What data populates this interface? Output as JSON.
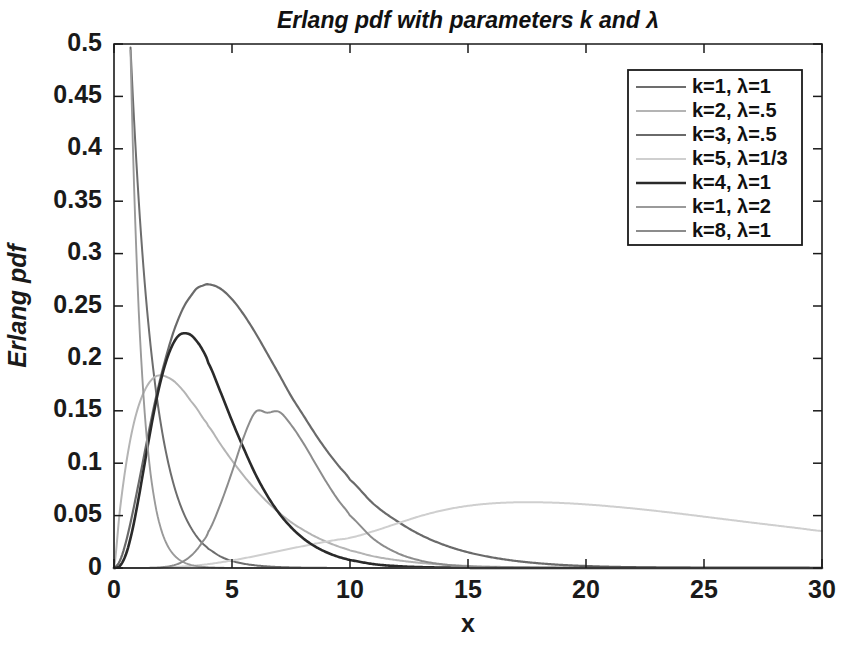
{
  "chart_data": {
    "type": "line",
    "title": "Erlang pdf with parameters k and λ",
    "xlabel": "x",
    "ylabel": "Erlang pdf",
    "xlim": [
      0,
      30
    ],
    "ylim": [
      0,
      0.5
    ],
    "xticks": [
      "0",
      "5",
      "10",
      "15",
      "20",
      "25",
      "30"
    ],
    "xtick_values": [
      0,
      5,
      10,
      15,
      20,
      25,
      30
    ],
    "yticks": [
      "0",
      "0.05",
      "0.1",
      "0.15",
      "0.2",
      "0.25",
      "0.3",
      "0.35",
      "0.4",
      "0.45",
      "0.5"
    ],
    "ytick_values": [
      0,
      0.05,
      0.1,
      0.15,
      0.2,
      0.25,
      0.3,
      0.35,
      0.4,
      0.45,
      0.5
    ],
    "grid": false,
    "legend_position": "top-right",
    "x": [
      0,
      0.25,
      0.5,
      0.75,
      1,
      1.25,
      1.5,
      1.75,
      2,
      2.25,
      2.5,
      2.75,
      3,
      3.25,
      3.5,
      3.75,
      4,
      4.5,
      5,
      5.5,
      6,
      6.5,
      7,
      7.5,
      8,
      8.5,
      9,
      9.5,
      10,
      11,
      12,
      13,
      14,
      15,
      16,
      17,
      18,
      19,
      20,
      21,
      22,
      23,
      24,
      25,
      26,
      27,
      28,
      29,
      30
    ],
    "series": [
      {
        "name": "k=1, λ=1",
        "k": 1,
        "lambda": 1,
        "color": "#6d6d6d",
        "width": 2.0,
        "peak_x": 0,
        "peak_y": 1.0,
        "values": [
          1,
          0.7788,
          0.6065,
          0.4724,
          0.3679,
          0.2865,
          0.2231,
          0.1738,
          0.1353,
          0.1054,
          0.0821,
          0.0639,
          0.0498,
          0.0388,
          0.0302,
          0.0235,
          0.0183,
          0.0111,
          0.0067,
          0.0041,
          0.0025,
          0.0015,
          0.0009,
          0.00055,
          0.00034,
          0.0002,
          0.00012,
          7.5e-05,
          4.54e-05,
          1.67e-05,
          6.14e-06,
          2.26e-06,
          8.3e-07,
          3e-07,
          1.1e-07,
          4e-08,
          1.5e-08,
          5.6e-09,
          2e-09,
          7.6e-10,
          2.8e-10,
          1e-10,
          4e-11,
          1.4e-11,
          5e-12,
          1.9e-12,
          7e-13,
          2.5e-13,
          9e-14
        ]
      },
      {
        "name": "k=2, λ=.5",
        "k": 2,
        "lambda": 0.5,
        "color": "#b4b4b4",
        "width": 2.0,
        "peak_x": 2,
        "peak_y": 0.1839,
        "values": [
          0,
          0.0551,
          0.0973,
          0.129,
          0.1516,
          0.167,
          0.1771,
          0.1826,
          0.1839,
          0.1822,
          0.179,
          0.1738,
          0.1673,
          0.1596,
          0.1524,
          0.1437,
          0.1353,
          0.1185,
          0.1026,
          0.0879,
          0.0747,
          0.0629,
          0.0527,
          0.0438,
          0.0366,
          0.0303,
          0.025,
          0.0206,
          0.0168,
          0.0111,
          0.00744,
          0.00485,
          0.00313,
          0.002,
          0.00127,
          0.0008,
          0.0005,
          0.00031,
          0.00019,
          0.000117,
          7.16e-05,
          4.36e-05,
          2.65e-05,
          1.6e-05,
          9.7e-06,
          5.8e-06,
          3.5e-06,
          2.1e-06,
          1.25e-06
        ]
      },
      {
        "name": "k=3, λ=.5",
        "k": 3,
        "lambda": 0.5,
        "color": "#6a6a6a",
        "width": 2.2,
        "peak_x": 4,
        "peak_y": 0.1353,
        "values": [
          0,
          0.0069,
          0.0243,
          0.0484,
          0.0758,
          0.1044,
          0.1329,
          0.1598,
          0.1839,
          0.205,
          0.2238,
          0.2389,
          0.251,
          0.2594,
          0.2666,
          0.2694,
          0.2707,
          0.2667,
          0.2565,
          0.2417,
          0.224,
          0.2044,
          0.1845,
          0.1642,
          0.1465,
          0.1288,
          0.1125,
          0.0979,
          0.0842,
          0.0611,
          0.0446,
          0.0315,
          0.0219,
          0.015,
          0.0102,
          0.0068,
          0.0045,
          0.0029,
          0.0019,
          0.0012,
          0.00079,
          0.0005,
          0.00032,
          0.0002,
          0.000126,
          7.85e-05,
          4.87e-05,
          3.02e-05,
          1.87e-05
        ]
      },
      {
        "name": "k=5, λ=1/3",
        "k": 5,
        "lambda": 0.333333,
        "color": "#cfcfcf",
        "width": 2.0,
        "peak_x": 12,
        "peak_y": 0.0627,
        "values": [
          0,
          1e-07,
          1.8e-06,
          8.5e-06,
          2.6e-05,
          6.05e-05,
          0.00012,
          0.000213,
          0.000349,
          0.000536,
          0.000782,
          0.001095,
          0.001479,
          0.001937,
          0.00247,
          0.003079,
          0.003763,
          0.005351,
          0.007198,
          0.009257,
          0.011476,
          0.013798,
          0.016168,
          0.018535,
          0.020852,
          0.023077,
          0.025176,
          0.027122,
          0.028896,
          0.035112,
          0.0425,
          0.0497,
          0.0554,
          0.0593,
          0.0616,
          0.06265,
          0.0627,
          0.062,
          0.0607,
          0.0589,
          0.0568,
          0.0544,
          0.0518,
          0.049,
          0.0462,
          0.0434,
          0.0407,
          0.038,
          0.0353
        ]
      },
      {
        "name": "k=4, λ=1",
        "k": 4,
        "lambda": 1,
        "color": "#2a2a2a",
        "width": 2.6,
        "peak_x": 3,
        "peak_y": 0.224,
        "values": [
          0,
          0.002,
          0.0126,
          0.0332,
          0.0613,
          0.0933,
          0.1255,
          0.1553,
          0.1804,
          0.2,
          0.2138,
          0.222,
          0.224,
          0.2224,
          0.2166,
          0.2082,
          0.1954,
          0.1687,
          0.1404,
          0.1139,
          0.0892,
          0.0688,
          0.0521,
          0.0389,
          0.0286,
          0.0208,
          0.015,
          0.0107,
          0.00757,
          0.00368,
          0.00177,
          0.00084,
          0.00039,
          0.00018,
          8.6e-05,
          3.9e-05,
          1.78e-05,
          8e-06,
          3.6e-06,
          1.6e-06,
          7e-07,
          3e-07,
          1.4e-07,
          6e-08,
          2.6e-08,
          1.1e-08,
          4.8e-09,
          2e-09,
          9e-10
        ]
      },
      {
        "name": "k=1, λ=2",
        "k": 1,
        "lambda": 2,
        "color": "#9a9a9a",
        "width": 1.9,
        "peak_x": 0,
        "peak_y": 2.0,
        "values": [
          2,
          1.2131,
          0.7358,
          0.4463,
          0.2707,
          0.1642,
          0.0996,
          0.0604,
          0.0366,
          0.0222,
          0.0135,
          0.0082,
          0.005,
          0.003,
          0.0018,
          0.0011,
          0.00067,
          0.00025,
          9e-05,
          3.3e-05,
          1.2e-05,
          4.5e-06,
          1.7e-06,
          6e-07,
          2.2e-07,
          8e-08,
          3e-08,
          1e-08,
          4.1e-09,
          5.5e-10,
          7.6e-11,
          1e-11,
          1.4e-12,
          1.9e-13,
          2.5e-14,
          0,
          0,
          0,
          0,
          0,
          0,
          0,
          0,
          0,
          0,
          0,
          0,
          0,
          0
        ]
      },
      {
        "name": "k=8, λ=1",
        "k": 8,
        "lambda": 1,
        "color": "#8c8c8c",
        "width": 2.0,
        "peak_x": 7,
        "peak_y": 0.149,
        "values": [
          0,
          0.0,
          1e-07,
          7e-07,
          7.3e-06,
          3.28e-05,
          0.000106,
          0.000278,
          0.000632,
          0.00129,
          0.00244,
          0.0043,
          0.00719,
          0.01138,
          0.0172,
          0.0249,
          0.0347,
          0.0603,
          0.0916,
          0.1252,
          0.149,
          0.1482,
          0.149,
          0.1367,
          0.12,
          0.101,
          0.082,
          0.0648,
          0.05,
          0.0277,
          0.0143,
          0.007,
          0.0033,
          0.00149,
          0.00066,
          0.000285,
          0.00012,
          5e-05,
          2.1e-05,
          8.5e-06,
          3.4e-06,
          1.4e-06,
          5e-07,
          2e-07,
          8e-08,
          3e-08,
          1e-08,
          4e-09,
          1.5e-09
        ]
      }
    ]
  },
  "legend": {
    "entries": [
      {
        "label": "k=1, λ=1"
      },
      {
        "label": "k=2, λ=.5"
      },
      {
        "label": "k=3, λ=.5"
      },
      {
        "label": "k=5, λ=1/3"
      },
      {
        "label": "k=4, λ=1"
      },
      {
        "label": "k=1, λ=2"
      },
      {
        "label": "k=8, λ=1"
      }
    ]
  }
}
